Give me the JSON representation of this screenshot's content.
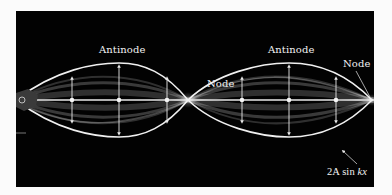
{
  "figure": {
    "colors": {
      "background": "#020202",
      "page": "#fbfbfb",
      "string": "#f0f0f0",
      "labels": "#f2f2f2"
    },
    "labels": {
      "antinode_left": "Antinode",
      "antinode_right": "Antinode",
      "node_center": "Node",
      "node_right": "Node",
      "envelope_formula_prefix": "2A sin ",
      "envelope_formula_var": "kx"
    },
    "geometry": {
      "axis_y": 89,
      "amplitude": 37,
      "node_x": [
        0,
        172,
        356
      ],
      "antinode_x": [
        103,
        273
      ],
      "marker_x": [
        56,
        103,
        151,
        226,
        273,
        320
      ]
    }
  }
}
